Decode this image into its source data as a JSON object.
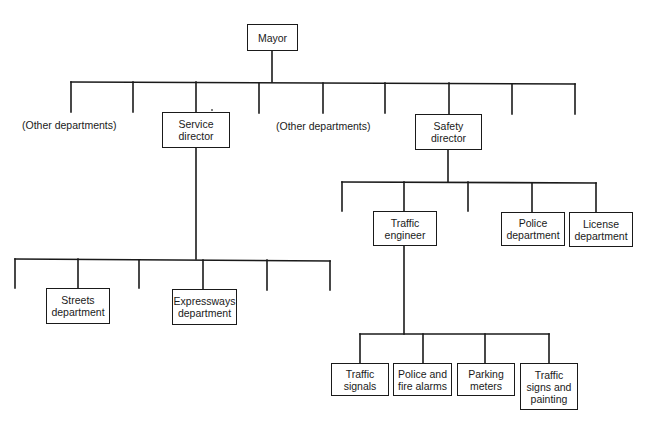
{
  "chart": {
    "title": "",
    "root": {
      "id": "mayor",
      "label": "Mayor",
      "children": [
        {
          "id": "other-departments-left",
          "label": "(Other departments)",
          "type": "unboxed-label"
        },
        {
          "id": "service-director",
          "label": "Service\ndirector",
          "children": [
            {
              "id": "streets-department",
              "label": "Streets\ndepartment"
            },
            {
              "id": "expressways-department",
              "label": "Expressways\ndepartment"
            }
          ]
        },
        {
          "id": "other-departments-middle",
          "label": "(Other departments)",
          "type": "unboxed-label"
        },
        {
          "id": "safety-director",
          "label": "Safety\ndirector",
          "children": [
            {
              "id": "traffic-engineer",
              "label": "Traffic\nengineer",
              "children": [
                {
                  "id": "traffic-signals",
                  "label": "Traffic\nsignals"
                },
                {
                  "id": "police-and-fire-alarms",
                  "label": "Police and\nfire alarms"
                },
                {
                  "id": "parking-meters",
                  "label": "Parking\nmeters"
                },
                {
                  "id": "traffic-signs-and-painting",
                  "label": "Traffic\nsigns and\npainting"
                }
              ]
            },
            {
              "id": "police-department",
              "label": "Police\ndepartment"
            },
            {
              "id": "license-department",
              "label": "License\ndepartment"
            }
          ]
        }
      ]
    }
  },
  "boxes": [
    {
      "name": "mayor-box",
      "label": "Mayor",
      "x": 247,
      "y": 24,
      "w": 51,
      "h": 27
    },
    {
      "name": "service-director-box",
      "label": "Service\ndirector",
      "x": 162,
      "y": 112,
      "w": 68,
      "h": 36
    },
    {
      "name": "safety-director-box",
      "label": "Safety\ndirector",
      "x": 415,
      "y": 114,
      "w": 67,
      "h": 36
    },
    {
      "name": "streets-department-box",
      "label": "Streets\ndepartment",
      "x": 46,
      "y": 288,
      "w": 64,
      "h": 36
    },
    {
      "name": "expressways-department-box",
      "label": "Expressways\ndepartment",
      "x": 172,
      "y": 289,
      "w": 65,
      "h": 36
    },
    {
      "name": "traffic-engineer-box",
      "label": "Traffic\nengineer",
      "x": 373,
      "y": 211,
      "w": 64,
      "h": 35
    },
    {
      "name": "police-department-box",
      "label": "Police\ndepartment",
      "x": 501,
      "y": 212,
      "w": 64,
      "h": 34
    },
    {
      "name": "license-department-box",
      "label": "License\ndepartment",
      "x": 569,
      "y": 212,
      "w": 64,
      "h": 35
    },
    {
      "name": "traffic-signals-box",
      "label": "Traffic\nsignals",
      "x": 331,
      "y": 363,
      "w": 58,
      "h": 33
    },
    {
      "name": "police-and-fire-alarms-box",
      "label": "Police and\nfire alarms",
      "x": 393,
      "y": 363,
      "w": 59,
      "h": 33
    },
    {
      "name": "parking-meters-box",
      "label": "Parking\nmeters",
      "x": 457,
      "y": 363,
      "w": 58,
      "h": 33
    },
    {
      "name": "traffic-signs-and-painting-box",
      "label": "Traffic\nsigns and\npainting",
      "x": 520,
      "y": 363,
      "w": 58,
      "h": 47
    }
  ],
  "labels": [
    {
      "name": "other-departments-left-label",
      "text": "(Other departments)",
      "x": 22,
      "y": 119
    },
    {
      "name": "other-departments-middle-label",
      "text": "(Other departments)",
      "x": 276,
      "y": 120
    }
  ],
  "lines": [
    {
      "x1": 272,
      "y1": 51,
      "x2": 272,
      "y2": 82
    },
    {
      "x1": 71,
      "y1": 82,
      "x2": 575,
      "y2": 84
    },
    {
      "x1": 71,
      "y1": 82,
      "x2": 71,
      "y2": 112
    },
    {
      "x1": 133,
      "y1": 82,
      "x2": 133,
      "y2": 112
    },
    {
      "x1": 196,
      "y1": 82,
      "x2": 196,
      "y2": 112
    },
    {
      "x1": 259,
      "y1": 83,
      "x2": 259,
      "y2": 113
    },
    {
      "x1": 323,
      "y1": 83,
      "x2": 323,
      "y2": 113
    },
    {
      "x1": 385,
      "y1": 83,
      "x2": 385,
      "y2": 113
    },
    {
      "x1": 449,
      "y1": 83,
      "x2": 449,
      "y2": 114
    },
    {
      "x1": 512,
      "y1": 84,
      "x2": 512,
      "y2": 114
    },
    {
      "x1": 575,
      "y1": 84,
      "x2": 575,
      "y2": 114
    },
    {
      "x1": 196,
      "y1": 148,
      "x2": 196,
      "y2": 259
    },
    {
      "x1": 15,
      "y1": 259,
      "x2": 330,
      "y2": 261
    },
    {
      "x1": 15,
      "y1": 259,
      "x2": 15,
      "y2": 288
    },
    {
      "x1": 78,
      "y1": 259,
      "x2": 78,
      "y2": 288
    },
    {
      "x1": 139,
      "y1": 260,
      "x2": 139,
      "y2": 288
    },
    {
      "x1": 203,
      "y1": 260,
      "x2": 203,
      "y2": 289
    },
    {
      "x1": 267,
      "y1": 260,
      "x2": 267,
      "y2": 290
    },
    {
      "x1": 330,
      "y1": 261,
      "x2": 330,
      "y2": 290
    },
    {
      "x1": 448,
      "y1": 150,
      "x2": 448,
      "y2": 182
    },
    {
      "x1": 342,
      "y1": 182,
      "x2": 596,
      "y2": 183
    },
    {
      "x1": 342,
      "y1": 182,
      "x2": 342,
      "y2": 211
    },
    {
      "x1": 404,
      "y1": 182,
      "x2": 404,
      "y2": 211
    },
    {
      "x1": 468,
      "y1": 182,
      "x2": 468,
      "y2": 211
    },
    {
      "x1": 532,
      "y1": 183,
      "x2": 532,
      "y2": 212
    },
    {
      "x1": 596,
      "y1": 183,
      "x2": 596,
      "y2": 212
    },
    {
      "x1": 404,
      "y1": 246,
      "x2": 404,
      "y2": 334
    },
    {
      "x1": 360,
      "y1": 334,
      "x2": 549,
      "y2": 334
    },
    {
      "x1": 360,
      "y1": 334,
      "x2": 360,
      "y2": 363
    },
    {
      "x1": 423,
      "y1": 334,
      "x2": 423,
      "y2": 363
    },
    {
      "x1": 485,
      "y1": 334,
      "x2": 485,
      "y2": 363
    },
    {
      "x1": 549,
      "y1": 334,
      "x2": 549,
      "y2": 363
    }
  ],
  "colors": {
    "ink": "#1a1a1a",
    "background": "#ffffff"
  }
}
